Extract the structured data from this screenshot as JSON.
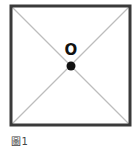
{
  "figure": {
    "caption": "圖1",
    "point_label": "O",
    "colors": {
      "border": "#3a3a3a",
      "diagonal": "#bdbdbd",
      "dot": "#111111"
    }
  }
}
